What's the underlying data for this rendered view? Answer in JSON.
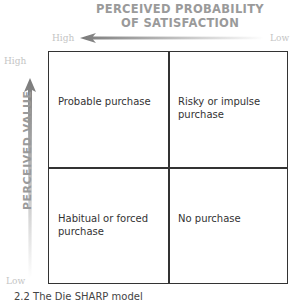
{
  "x_axis": {
    "title_line1": "PERCEIVED PROBABILITY",
    "title_line2": "OF SATISFACTION",
    "high_label": "High",
    "low_label": "Low"
  },
  "y_axis": {
    "title": "PERCEIVED VALUE",
    "high_label": "High",
    "low_label": "Low"
  },
  "quadrants": {
    "top_left": "Probable purchase",
    "top_right_line1": "Risky or impulse",
    "top_right_line2": "purchase",
    "bottom_left_line1": "Habitual or forced",
    "bottom_left_line2": "purchase",
    "bottom_right": "No purchase"
  },
  "caption": "2.2   The Die SHARP model"
}
